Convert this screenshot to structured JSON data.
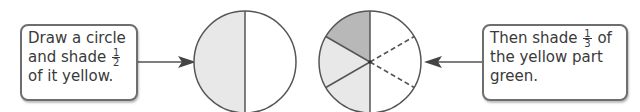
{
  "left_box": {
    "line1": "Draw a circle",
    "line2_pre": "and shade",
    "fraction": {
      "numerator": "1",
      "denominator": "2"
    },
    "line3": "of it yellow."
  },
  "right_box": {
    "line1_pre": "Then shade",
    "fraction": {
      "numerator": "1",
      "denominator": "3"
    },
    "line1_post": "of",
    "line2": "the yellow part",
    "line3": "green."
  },
  "colors": {
    "stroke": "#555555",
    "yellow_shade": "#e8e8e8",
    "green_shade": "#b8b8b8",
    "background": "#ffffff"
  },
  "circle_1": {
    "description": "circle divided in half, left half shaded"
  },
  "circle_2": {
    "description": "circle in sixths; left half shaded, top-left sixth darker; right half split by dashed lines"
  }
}
